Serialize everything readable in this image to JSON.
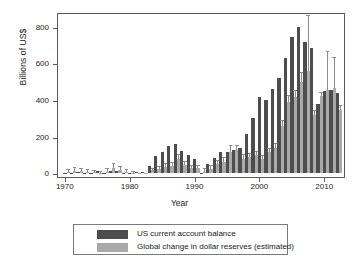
{
  "chart_data": {
    "type": "bar",
    "title": "",
    "xlabel": "Year",
    "ylabel": "Billions of US$",
    "xlim": [
      1968.8,
      2013.2
    ],
    "ylim": [
      -20,
      880
    ],
    "yticks": [
      0,
      200,
      400,
      600,
      800
    ],
    "xticks": [
      1970,
      1980,
      1990,
      2000,
      2010
    ],
    "grid": false,
    "legend_position": "below-axes",
    "bar_overlap": "light series drawn in front of dark series, offset right",
    "x": [
      1970,
      1971,
      1972,
      1973,
      1974,
      1975,
      1976,
      1977,
      1978,
      1979,
      1980,
      1981,
      1982,
      1983,
      1984,
      1985,
      1986,
      1987,
      1988,
      1989,
      1990,
      1991,
      1992,
      1993,
      1994,
      1995,
      1996,
      1997,
      1998,
      1999,
      2000,
      2001,
      2002,
      2003,
      2004,
      2005,
      2006,
      2007,
      2008,
      2009,
      2010,
      2011,
      2012
    ],
    "series": [
      {
        "name": "US current account balance",
        "color": "#4d4d4d",
        "values": [
          3,
          2,
          6,
          1,
          2,
          12,
          4,
          14,
          15,
          1,
          2,
          5,
          5,
          38,
          94,
          118,
          147,
          160,
          121,
          99,
          79,
          3,
          50,
          82,
          118,
          114,
          125,
          141,
          215,
          301,
          416,
          398,
          459,
          522,
          631,
          745,
          800,
          718,
          686,
          381,
          449,
          457,
          440
        ]
      },
      {
        "name": "Global change in dollar reserves (estimated)",
        "color": "#a9a9a9",
        "values": [
          8,
          14,
          12,
          9,
          6,
          4,
          10,
          28,
          18,
          9,
          4,
          2,
          2,
          16,
          22,
          36,
          40,
          78,
          45,
          30,
          28,
          10,
          25,
          50,
          60,
          115,
          130,
          80,
          88,
          100,
          80,
          118,
          140,
          260,
          390,
          415,
          500,
          560,
          320,
          420,
          455,
          465,
          345
        ]
      }
    ],
    "errorbars": {
      "applies_to": "Global change in dollar reserves (estimated)",
      "upper": [
        20,
        28,
        25,
        20,
        14,
        9,
        22,
        52,
        33,
        18,
        8,
        5,
        5,
        26,
        33,
        50,
        55,
        100,
        60,
        42,
        38,
        22,
        38,
        68,
        82,
        148,
        148,
        100,
        105,
        118,
        95,
        135,
        160,
        285,
        420,
        450,
        545,
        860,
        340,
        440,
        660,
        630,
        370
      ]
    }
  },
  "legend": {
    "items": [
      {
        "label": "US current account balance",
        "color": "#4d4d4d"
      },
      {
        "label": "Global change in dollar reserves (estimated)",
        "color": "#a9a9a9"
      }
    ]
  },
  "axis_text": {
    "y_title": "Billions of US$",
    "x_title": "Year",
    "yticklabels": [
      "0",
      "200",
      "400",
      "600",
      "800"
    ],
    "xticklabels": [
      "1970",
      "1980",
      "1990",
      "2000",
      "2010"
    ]
  }
}
